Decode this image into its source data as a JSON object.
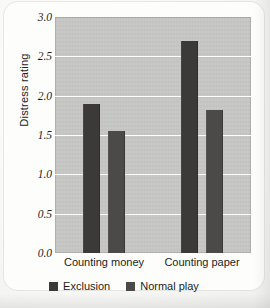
{
  "chart_data": {
    "type": "bar",
    "title": "",
    "xlabel": "",
    "ylabel": "Distress rating",
    "categories": [
      "Counting money",
      "Counting paper"
    ],
    "series": [
      {
        "name": "Exclusion",
        "values": [
          1.9,
          2.7
        ],
        "color": "#3b3a38"
      },
      {
        "name": "Normal play",
        "values": [
          1.55,
          1.82
        ],
        "color": "#4b4a48"
      }
    ],
    "ylim": [
      0.0,
      3.0
    ],
    "ytick_labels": [
      "0.0",
      "0.5",
      "1.0",
      "1.5",
      "2.0",
      "2.5",
      "3.0"
    ],
    "ytick_values": [
      0.0,
      0.5,
      1.0,
      1.5,
      2.0,
      2.5,
      3.0
    ],
    "grid": true,
    "grid_color": "#ffffff",
    "legend_position": "bottom",
    "plot_background": "#c6c6c4",
    "page_background": "#fbfbfa"
  }
}
